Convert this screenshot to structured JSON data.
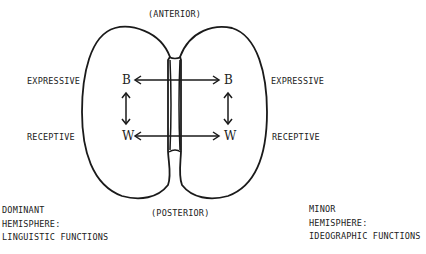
{
  "labels": {
    "anterior": "(ANTERIOR)",
    "posterior": "(POSTERIOR)",
    "left_expressive": "EXPRESSIVE",
    "left_receptive": "RECEPTIVE",
    "right_expressive": "EXPRESSIVE",
    "right_receptive": "RECEPTIVE"
  },
  "areas": {
    "left_b": "B",
    "left_w": "W",
    "right_b": "B",
    "right_w": "W"
  },
  "left_hemisphere": {
    "lines": [
      "DOMINANT",
      "HEMISPHERE:",
      "LINGUISTIC FUNCTIONS"
    ]
  },
  "right_hemisphere": {
    "lines": [
      "MINOR",
      "HEMISPHERE:",
      "IDEOGRAPHIC FUNCTIONS"
    ]
  },
  "colors": {
    "stroke": "#1a1a1a",
    "background": "#ffffff"
  }
}
